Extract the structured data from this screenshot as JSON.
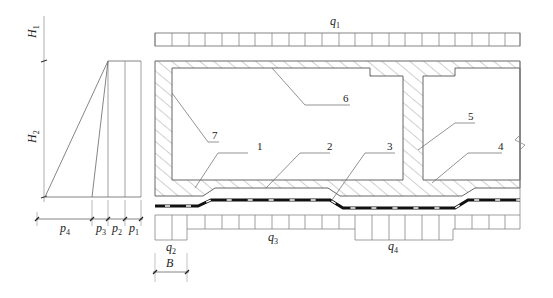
{
  "figure": {
    "type": "structural cross-section diagram",
    "colors": {
      "line": "#555555",
      "thick_line": "#111111",
      "hatch": "#666666",
      "background": "#ffffff"
    }
  },
  "pressure_diagram": {
    "height_labels": [
      {
        "main": "H",
        "sub": "1"
      },
      {
        "main": "H",
        "sub": "2"
      }
    ],
    "pressure_labels": [
      {
        "main": "p",
        "sub": "4"
      },
      {
        "main": "p",
        "sub": "3"
      },
      {
        "main": "p",
        "sub": "2"
      },
      {
        "main": "p",
        "sub": "1"
      }
    ]
  },
  "loads": {
    "top": {
      "main": "q",
      "sub": "1"
    },
    "bottom": [
      {
        "main": "q",
        "sub": "2"
      },
      {
        "main": "q",
        "sub": "3"
      },
      {
        "main": "q",
        "sub": "4"
      }
    ]
  },
  "dimension": {
    "main": "B"
  },
  "callouts": [
    {
      "id": "1",
      "label": "1"
    },
    {
      "id": "2",
      "label": "2"
    },
    {
      "id": "3",
      "label": "3"
    },
    {
      "id": "4",
      "label": "4"
    },
    {
      "id": "5",
      "label": "5"
    },
    {
      "id": "6",
      "label": "6"
    },
    {
      "id": "7",
      "label": "7"
    }
  ]
}
